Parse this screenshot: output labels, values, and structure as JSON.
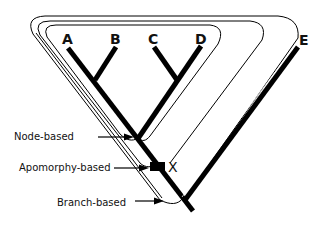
{
  "figure": {
    "taxa": [
      {
        "id": "A",
        "label": "A"
      },
      {
        "id": "B",
        "label": "B"
      },
      {
        "id": "C",
        "label": "C"
      },
      {
        "id": "D",
        "label": "D"
      },
      {
        "id": "E",
        "label": "E"
      }
    ],
    "apomorphy_marker": {
      "label": "X"
    },
    "definitions": [
      {
        "id": "node",
        "label": "Node-based"
      },
      {
        "id": "apomorphy",
        "label": "Apomorphy-based"
      },
      {
        "id": "branch",
        "label": "Branch-based"
      }
    ],
    "colors": {
      "ink": "#000000",
      "background": "#ffffff"
    }
  }
}
